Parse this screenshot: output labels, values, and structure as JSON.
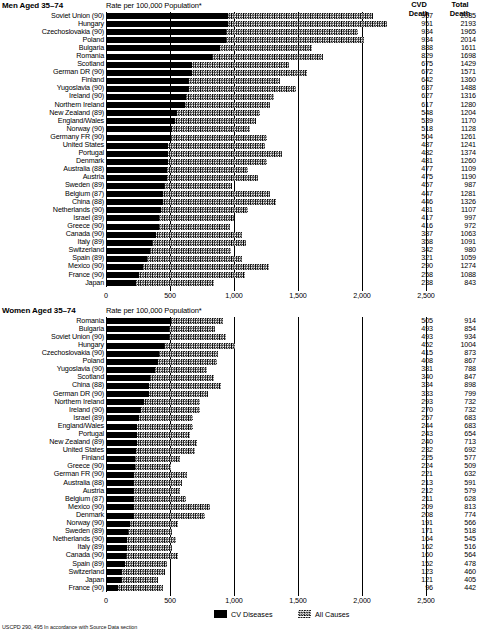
{
  "axis": {
    "ticks": [
      0,
      500,
      1000,
      1500,
      2000,
      2500
    ],
    "tick_labels": [
      "0",
      "500",
      "1,000",
      "1,500",
      "2,000",
      "2,500"
    ],
    "max": 2500
  },
  "columns": {
    "cvd_header_line1": "CVD",
    "cvd_header_line2": "Death",
    "total_header_line1": "Total",
    "total_header_line2": "Death"
  },
  "legend": {
    "cvd_label": "CV Diseases",
    "all_label": "All Causes"
  },
  "footnote": "USCPD 290, 495 In accordance with Source Data section",
  "men": {
    "title": "Men Aged 35–74",
    "subtitle": "Rate per 100,000 Population*"
  },
  "women": {
    "title": "Women Aged 35–74",
    "subtitle": "Rate per 100,000 Population*"
  },
  "chart_data": [
    {
      "type": "bar",
      "orientation": "horizontal",
      "title": "Men Aged 35–74",
      "subtitle": "Rate per 100,000 Population*",
      "xlabel": "Rate per 100,000 Population*",
      "ylabel": "",
      "xlim": [
        0,
        2500
      ],
      "grid": true,
      "legend": [
        "CV Diseases",
        "All Causes"
      ],
      "legend_position": "bottom-center",
      "categories": [
        "Soviet Union (90)",
        "Hungary",
        "Czechoslovakia (90)",
        "Poland",
        "Bulgaria",
        "Romania",
        "Scotland",
        "German DR (90)",
        "Finland",
        "Yugoslavia (90)",
        "Ireland (90)",
        "Northern Ireland",
        "New Zealand (89)",
        "England/Wales",
        "Norway (90)",
        "Germany FR (90)",
        "United States",
        "Portugal",
        "Denmark",
        "Australia (88)",
        "Austria",
        "Sweden (89)",
        "Belgium (87)",
        "China (88)",
        "Netherlands (90)",
        "Israel (89)",
        "Greece (90)",
        "Canada (90)",
        "Italy (89)",
        "Switzerland",
        "Spain (89)",
        "Mexico (90)",
        "France (90)",
        "Japan"
      ],
      "series": [
        {
          "name": "CV Diseases",
          "values": [
            957,
            951,
            934,
            934,
            888,
            829,
            675,
            672,
            642,
            637,
            627,
            617,
            548,
            539,
            518,
            504,
            487,
            482,
            481,
            477,
            475,
            457,
            447,
            446,
            431,
            417,
            416,
            387,
            358,
            342,
            321,
            290,
            258,
            238
          ]
        },
        {
          "name": "All Causes",
          "values": [
            2085,
            2193,
            1965,
            2014,
            1611,
            1698,
            1429,
            1571,
            1360,
            1488,
            1316,
            1280,
            1204,
            1170,
            1128,
            1261,
            1241,
            1374,
            1260,
            1109,
            1190,
            987,
            1281,
            1326,
            1107,
            997,
            972,
            1063,
            1091,
            980,
            1059,
            1274,
            1088,
            843
          ]
        }
      ]
    },
    {
      "type": "bar",
      "orientation": "horizontal",
      "title": "Women Aged 35–74",
      "subtitle": "Rate per 100,000 Population*",
      "xlabel": "Rate per 100,000 Population*",
      "ylabel": "",
      "xlim": [
        0,
        2500
      ],
      "grid": true,
      "legend": [
        "CV Diseases",
        "All Causes"
      ],
      "legend_position": "bottom-center",
      "categories": [
        "Romania",
        "Bulgaria",
        "Soviet Union (90)",
        "Hungary",
        "Czechoslovakia (90)",
        "Poland",
        "Yugoslavia (90)",
        "Scotland",
        "China (88)",
        "German DR (90)",
        "Northern Ireland",
        "Ireland (90)",
        "Israel (89)",
        "England/Wales",
        "Portugal",
        "New Zealand (89)",
        "United States",
        "Finland",
        "Greece (90)",
        "German FR (90)",
        "Australia (88)",
        "Austria",
        "Belgium (87)",
        "Mexico (90)",
        "Denmark",
        "Norway (90)",
        "Sweden (89)",
        "Netherlands (90)",
        "Italy (89)",
        "Canada (90)",
        "Spain (89)",
        "Switzerland",
        "Japan",
        "France (90)"
      ],
      "series": [
        {
          "name": "CV Diseases",
          "values": [
            505,
            493,
            493,
            452,
            415,
            408,
            381,
            340,
            334,
            333,
            293,
            270,
            257,
            244,
            243,
            240,
            232,
            225,
            224,
            221,
            213,
            212,
            211,
            209,
            208,
            191,
            171,
            164,
            162,
            160,
            152,
            123,
            121,
            96
          ]
        },
        {
          "name": "All Causes",
          "values": [
            914,
            854,
            934,
            1004,
            873,
            867,
            788,
            847,
            898,
            799,
            732,
            732,
            683,
            683,
            654,
            713,
            692,
            577,
            509,
            632,
            591,
            579,
            628,
            813,
            774,
            566,
            518,
            545,
            516,
            564,
            478,
            460,
            405,
            442
          ]
        }
      ]
    }
  ]
}
